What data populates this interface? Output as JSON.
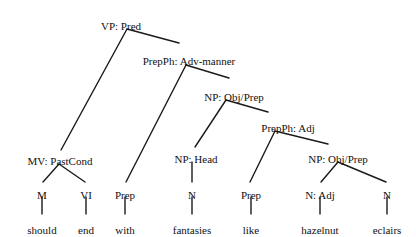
{
  "diagram": {
    "kind": "syntax-tree",
    "sentence": "should end with fantasies like hazelnut eclairs",
    "line_color": "#1a1a1a",
    "text_color": "#111111",
    "background": "#ffffff",
    "nodes": [
      {
        "id": "vp_pred",
        "label": "VP: Pred",
        "cx": 121,
        "cy": 21
      },
      {
        "id": "prepph_advm",
        "label": "PrepPh: Adv-manner",
        "cx": 189,
        "cy": 56
      },
      {
        "id": "np_objprep_1",
        "label": "NP: Obj/Prep",
        "cx": 234,
        "cy": 92
      },
      {
        "id": "prepph_adj",
        "label": "PrepPh: Adj",
        "cx": 288,
        "cy": 123
      },
      {
        "id": "np_objprep_2",
        "label": "NP: Obj/Prep",
        "cx": 338,
        "cy": 154
      },
      {
        "id": "mv_pastcond",
        "label": "MV: PastCond",
        "cx": 60,
        "cy": 156
      },
      {
        "id": "np_head",
        "label": "NP: Head",
        "cx": 196,
        "cy": 154
      },
      {
        "id": "pos_m",
        "label": "M",
        "cx": 42,
        "cy": 190
      },
      {
        "id": "pos_vi",
        "label": "VI",
        "cx": 86,
        "cy": 190
      },
      {
        "id": "pos_prep_1",
        "label": "Prep",
        "cx": 125,
        "cy": 190
      },
      {
        "id": "pos_n_1",
        "label": "N",
        "cx": 192,
        "cy": 190
      },
      {
        "id": "pos_prep_2",
        "label": "Prep",
        "cx": 251,
        "cy": 190
      },
      {
        "id": "pos_n_adj",
        "label": "N: Adj",
        "cx": 320,
        "cy": 190
      },
      {
        "id": "pos_n_2",
        "label": "N",
        "cx": 387,
        "cy": 190
      }
    ],
    "leaves": [
      {
        "id": "word_should",
        "label": "should",
        "cx": 42,
        "cy": 225
      },
      {
        "id": "word_end",
        "label": "end",
        "cx": 86,
        "cy": 225
      },
      {
        "id": "word_with",
        "label": "with",
        "cx": 125,
        "cy": 225
      },
      {
        "id": "word_fantasies",
        "label": "fantasies",
        "cx": 192,
        "cy": 225
      },
      {
        "id": "word_like",
        "label": "like",
        "cx": 251,
        "cy": 225
      },
      {
        "id": "word_hazelnut",
        "label": "hazelnut",
        "cx": 320,
        "cy": 225
      },
      {
        "id": "word_eclairs",
        "label": "eclairs",
        "cx": 387,
        "cy": 225
      }
    ],
    "edges": [
      {
        "id": "edge-vp-to-mv",
        "x1": 127,
        "y1": 29,
        "x2": 61,
        "y2": 150
      },
      {
        "id": "edge-vp-to-prepph-advm",
        "x1": 127,
        "y1": 29,
        "x2": 179,
        "y2": 43
      },
      {
        "id": "edge-advm-to-prep1",
        "x1": 186,
        "y1": 65,
        "x2": 126,
        "y2": 182
      },
      {
        "id": "edge-advm-to-np1",
        "x1": 186,
        "y1": 65,
        "x2": 229,
        "y2": 78
      },
      {
        "id": "edge-np1-to-nphead",
        "x1": 226,
        "y1": 100,
        "x2": 195,
        "y2": 147
      },
      {
        "id": "edge-np1-to-prepph-adj",
        "x1": 226,
        "y1": 100,
        "x2": 268,
        "y2": 112
      },
      {
        "id": "edge-adj-to-prep2",
        "x1": 275,
        "y1": 131,
        "x2": 250,
        "y2": 182
      },
      {
        "id": "edge-adj-to-np2",
        "x1": 275,
        "y1": 131,
        "x2": 328,
        "y2": 144
      },
      {
        "id": "edge-mv-to-m",
        "x1": 59,
        "y1": 164,
        "x2": 43,
        "y2": 182
      },
      {
        "id": "edge-mv-to-vi",
        "x1": 59,
        "y1": 164,
        "x2": 85,
        "y2": 182
      },
      {
        "id": "edge-np2-to-nadj",
        "x1": 338,
        "y1": 162,
        "x2": 321,
        "y2": 182
      },
      {
        "id": "edge-np2-to-n2",
        "x1": 338,
        "y1": 162,
        "x2": 386,
        "y2": 182
      },
      {
        "id": "edge-nphead-to-n1",
        "x1": 192,
        "y1": 162,
        "x2": 192,
        "y2": 182
      },
      {
        "id": "edge-m-to-should",
        "x1": 42,
        "y1": 197,
        "x2": 42,
        "y2": 214
      },
      {
        "id": "edge-vi-to-end",
        "x1": 86,
        "y1": 197,
        "x2": 86,
        "y2": 214
      },
      {
        "id": "edge-prep1-to-with",
        "x1": 125,
        "y1": 197,
        "x2": 125,
        "y2": 214
      },
      {
        "id": "edge-n1-to-fantasies",
        "x1": 192,
        "y1": 197,
        "x2": 192,
        "y2": 214
      },
      {
        "id": "edge-prep2-to-like",
        "x1": 251,
        "y1": 197,
        "x2": 251,
        "y2": 214
      },
      {
        "id": "edge-nadj-to-hazelnut",
        "x1": 320,
        "y1": 197,
        "x2": 320,
        "y2": 214
      },
      {
        "id": "edge-n2-to-eclairs",
        "x1": 387,
        "y1": 197,
        "x2": 387,
        "y2": 214
      }
    ]
  }
}
